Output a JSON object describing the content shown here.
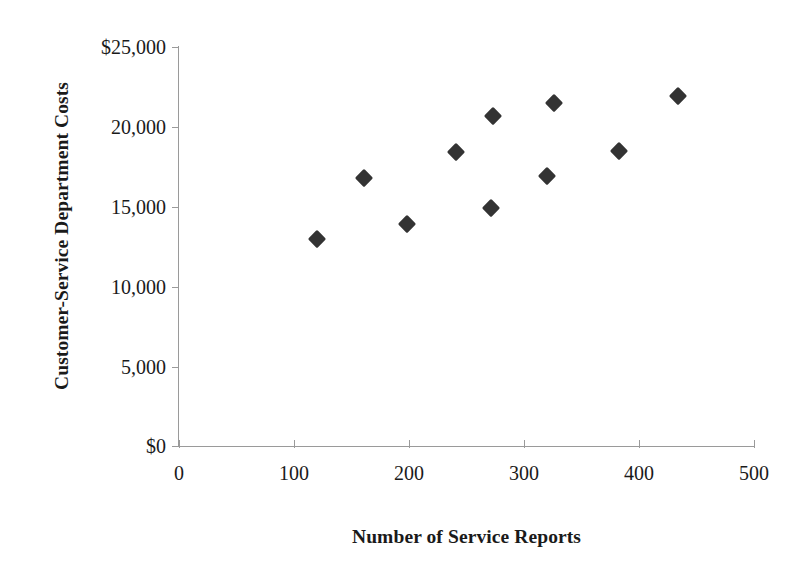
{
  "chart_data": {
    "type": "scatter",
    "title": "",
    "xlabel": "Number of Service Reports",
    "ylabel": "Customer-Service Department Costs",
    "xlim": [
      0,
      500
    ],
    "ylim": [
      0,
      25000
    ],
    "xticks": [
      0,
      100,
      200,
      300,
      400,
      500
    ],
    "xtick_labels": [
      "0",
      "100",
      "200",
      "300",
      "400",
      "500"
    ],
    "yticks": [
      0,
      5000,
      10000,
      15000,
      20000,
      25000
    ],
    "ytick_labels": [
      "$0",
      "5,000",
      "10,000",
      "15,000",
      "20,000",
      "$25,000"
    ],
    "grid": false,
    "legend": false,
    "marker_style": "filled-diamond",
    "marker_color": "#333333",
    "axis_color": "#9a9a9a",
    "points": [
      {
        "x": 120,
        "y": 13000
      },
      {
        "x": 161,
        "y": 16800
      },
      {
        "x": 198,
        "y": 13900
      },
      {
        "x": 241,
        "y": 18400
      },
      {
        "x": 271,
        "y": 14900
      },
      {
        "x": 273,
        "y": 20700
      },
      {
        "x": 320,
        "y": 16900
      },
      {
        "x": 326,
        "y": 21500
      },
      {
        "x": 383,
        "y": 18500
      },
      {
        "x": 434,
        "y": 21900
      }
    ]
  },
  "axes": {
    "y_title": "Customer-Service Department Costs",
    "x_title": "Number of Service Reports",
    "y_labels": [
      "$25,000",
      "20,000",
      "15,000",
      "10,000",
      "5,000",
      "$0"
    ],
    "x_labels": [
      "0",
      "100",
      "200",
      "300",
      "400",
      "500"
    ]
  }
}
